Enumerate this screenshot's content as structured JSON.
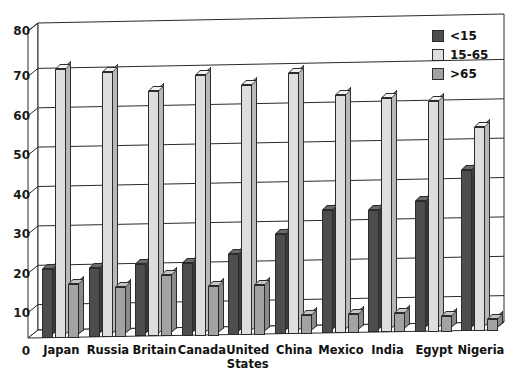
{
  "chart_data": {
    "type": "bar",
    "title": "",
    "subtitle": "",
    "xlabel": "",
    "ylabel": "",
    "ylim": [
      0,
      80
    ],
    "ytick_step": 10,
    "yticks": [
      0,
      10,
      20,
      30,
      40,
      50,
      60,
      70,
      80
    ],
    "grid": true,
    "legend_position": "top-right",
    "style": "3d-column",
    "categories": [
      "Japan",
      "Russia",
      "Britain",
      "Canada",
      "United States",
      "China",
      "Mexico",
      "India",
      "Egypt",
      "Nigeria"
    ],
    "series": [
      {
        "name": "<15",
        "color": "#4d4d4d",
        "values": [
          18,
          18,
          19,
          19,
          21,
          26,
          32,
          32,
          34,
          42
        ]
      },
      {
        "name": "15-65",
        "color": "#dedede",
        "values": [
          70,
          69,
          64,
          68,
          65,
          68,
          62,
          61,
          60,
          53
        ]
      },
      {
        "name": ">65",
        "color": "#a3a3a3",
        "values": [
          14,
          13,
          16,
          13,
          13,
          5,
          5,
          5,
          4,
          3
        ]
      }
    ]
  },
  "legend": {
    "items": [
      {
        "label": "<15",
        "color": "#4d4d4d"
      },
      {
        "label": "15-65",
        "color": "#dedede"
      },
      {
        "label": ">65",
        "color": "#a3a3a3"
      }
    ]
  },
  "axis": {
    "y_tick_labels": [
      "80",
      "70",
      "60",
      "50",
      "40",
      "30",
      "20",
      "10",
      "0"
    ]
  }
}
